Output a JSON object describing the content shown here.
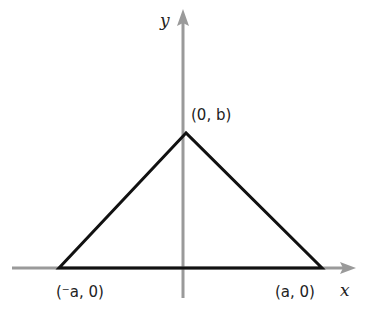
{
  "diagram": {
    "type": "triangle-on-axes",
    "axes": {
      "x_label": "x",
      "y_label": "y",
      "axis_color": "#9a9a9a"
    },
    "triangle": {
      "stroke_color": "#111111",
      "vertices": [
        {
          "name": "apex",
          "label": "(0, b)"
        },
        {
          "name": "left",
          "label": "(⁻a, 0)"
        },
        {
          "name": "right",
          "label": "(a, 0)"
        }
      ]
    }
  }
}
